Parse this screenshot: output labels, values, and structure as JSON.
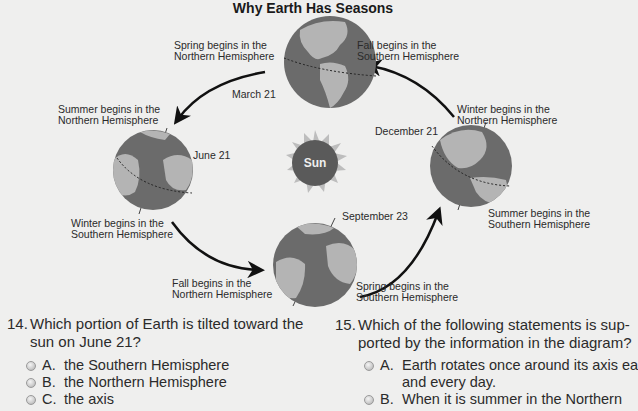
{
  "diagram": {
    "title": "Why Earth Has Seasons",
    "sun_label": "Sun",
    "colors": {
      "ocean": "#6b6b6b",
      "land": "#b4b4b4",
      "sun_core": "#5a5a5a",
      "sun_rays": "#bdbdbd",
      "arrow": "#111111",
      "background": "#efefee"
    },
    "positions": [
      {
        "date": "March 21",
        "label_1": "Spring begins in the\nNorthern Hemisphere",
        "label_1_lines": [
          "Spring begins in the",
          "Northern Hemisphere"
        ],
        "label_2_lines": [
          "Fall begins in the",
          "Southern Hemisphere"
        ]
      },
      {
        "date": "June 21",
        "label_1_lines": [
          "Summer begins in the",
          "Northern Hemisphere"
        ],
        "label_2_lines": [
          "Winter begins in the",
          "Southern Hemisphere"
        ]
      },
      {
        "date": "September 23",
        "label_1_lines": [
          "Fall begins in the",
          "Northern Hemisphere"
        ],
        "label_2_lines": [
          "Spring begins in the",
          "Southern Hemisphere"
        ]
      },
      {
        "date": "December 21",
        "label_1_lines": [
          "Winter begins in the",
          "Northern Hemisphere"
        ],
        "label_2_lines": [
          "Summer begins in the",
          "Southern Hemisphere"
        ]
      }
    ]
  },
  "questions": [
    {
      "number": "14.",
      "text_lines": [
        "Which portion of Earth is tilted toward the",
        "sun on June 21?"
      ],
      "options": [
        {
          "letter": "A.",
          "text": "the Southern Hemisphere"
        },
        {
          "letter": "B.",
          "text": "the Northern Hemisphere"
        },
        {
          "letter": "C.",
          "text": "the axis"
        }
      ]
    },
    {
      "number": "15.",
      "text_lines": [
        "Which of the following statements is sup-",
        "ported by the information in the diagram?"
      ],
      "options": [
        {
          "letter": "A.",
          "text_lines": [
            "Earth rotates once around its axis ea",
            "and every day."
          ]
        },
        {
          "letter": "B.",
          "text": "When it is summer in the Northern"
        }
      ]
    }
  ]
}
